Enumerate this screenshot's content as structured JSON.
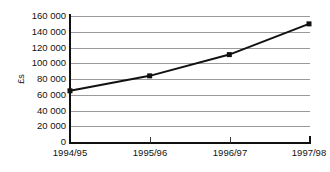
{
  "chart_data": {
    "type": "line",
    "title": "",
    "subtitle": "",
    "xlabel": "",
    "ylabel": "£s",
    "categories": [
      "1994/95",
      "1995/96",
      "1996/97",
      "1997/98"
    ],
    "values": [
      65000,
      84000,
      111000,
      150000
    ],
    "series": [
      {
        "name": "",
        "values": [
          65000,
          84000,
          111000,
          150000
        ]
      }
    ],
    "ylim": [
      0,
      160000
    ],
    "ytick_step": 20000,
    "ytick_labels": [
      "160 000",
      "140 000",
      "120 000",
      "100 000",
      "80 000",
      "60 000",
      "40 000",
      "20 000",
      "0"
    ],
    "ytick_values": [
      160000,
      140000,
      120000,
      100000,
      80000,
      60000,
      40000,
      20000,
      0
    ],
    "grid": true,
    "grid_orientation": "horizontal",
    "legend": false,
    "legend_position": "none",
    "marker": "square",
    "colors": {
      "line": "#111111",
      "marker": "#111111",
      "grid": "#9a9a9a",
      "axis": "#101010",
      "text": "#111111",
      "background": "#ffffff"
    }
  }
}
